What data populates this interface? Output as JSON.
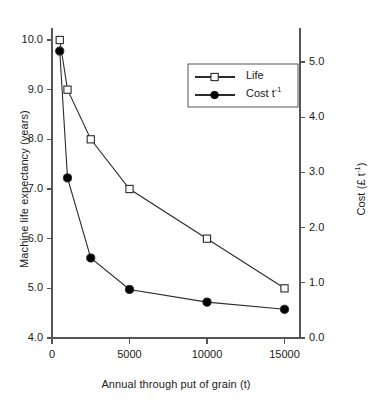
{
  "chart_data": {
    "type": "line",
    "title": "",
    "xlabel": "Annual through put of grain (t)",
    "ylabel": "Machine life expectancy (years)",
    "y2label": "Cost (£ t⁻¹)",
    "xlim": [
      0,
      16000
    ],
    "ylim": [
      4.0,
      10.0
    ],
    "y2lim": [
      0.0,
      5.4
    ],
    "grid": false,
    "legend_position": "upper-right-inside",
    "x_ticks": [
      0,
      5000,
      10000,
      15000
    ],
    "x_tick_labels": [
      "0",
      "5000",
      "10000",
      "15000"
    ],
    "y_ticks": [
      4.0,
      5.0,
      6.0,
      7.0,
      8.0,
      9.0,
      10.0
    ],
    "y_tick_labels": [
      "4.0",
      "5.0",
      "6.0",
      "7.0",
      "8.0",
      "9.0",
      "10.0"
    ],
    "y2_ticks": [
      0.0,
      1.0,
      2.0,
      3.0,
      4.0,
      5.0
    ],
    "y2_tick_labels": [
      "0.0",
      "1.0",
      "2.0",
      "3.0",
      "4.0",
      "5.0"
    ],
    "x": [
      500,
      1000,
      2500,
      5000,
      10000,
      15000
    ],
    "series": [
      {
        "name": "Life",
        "axis": "left",
        "marker": "open-square",
        "values": [
          10.0,
          9.0,
          8.0,
          7.0,
          6.0,
          5.0
        ]
      },
      {
        "name": "Cost t-1",
        "axis": "right",
        "marker": "filled-circle",
        "values": [
          5.2,
          2.9,
          1.45,
          0.88,
          0.65,
          0.52
        ]
      }
    ]
  },
  "legend": {
    "entries": [
      {
        "label": "Life",
        "marker": "open-square"
      },
      {
        "label": "Cost t",
        "sup": "-1",
        "marker": "filled-circle"
      }
    ]
  },
  "axes": {
    "y_left_title": "Machine life expectancy (years)",
    "x_title": "Annual through put of grain (t)",
    "y_right_title_main": "Cost (£ t",
    "y_right_title_sup": "-1",
    "y_right_title_close": ")"
  },
  "colors": {
    "line": "#2b2b2b",
    "axis": "#555555",
    "text": "#1a1a1a",
    "background": "#ffffff",
    "marker_fill_open": "#ffffff",
    "marker_fill_solid": "#000000"
  }
}
